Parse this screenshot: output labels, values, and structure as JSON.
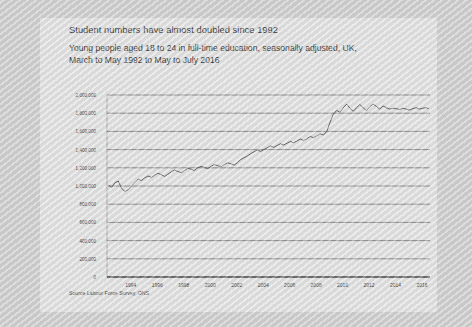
{
  "title": "Student numbers have almost doubled since 1992",
  "subtitle": "Young people aged 18 to 24 in full-time education, seasonally adjusted, UK, March to May 1992 to May to July 2016",
  "source": "Source Labour Force Survey, ONS",
  "colors": {
    "page_background": "#cfcfcf",
    "card_background": "#e3e3e3",
    "line": "#4a4a4a",
    "gridline": "#6f6f6f",
    "axis": "#3a3a3a",
    "text": "#2b2b2b"
  },
  "chart_data": {
    "type": "line",
    "title": "Student numbers have almost doubled since 1992",
    "subtitle": "Young people aged 18 to 24 in full-time education, seasonally adjusted, UK, March to May 1992 to May to July 2016",
    "xlabel": "",
    "ylabel": "",
    "grid": true,
    "legend": false,
    "xlim": [
      1992.2,
      2016.6
    ],
    "ylim": [
      0,
      2000000
    ],
    "ytick_labels": [
      "2,000,000",
      "1,800,000",
      "1,600,000",
      "1,400,000",
      "1,200,000",
      "1,000,000",
      "800,000",
      "600,000",
      "400,000",
      "200,000",
      "0"
    ],
    "ytick_values": [
      2000000,
      1800000,
      1600000,
      1400000,
      1200000,
      1000000,
      800000,
      600000,
      400000,
      200000,
      0
    ],
    "xtick_labels": [
      "1994",
      "1996",
      "1998",
      "2000",
      "2002",
      "2004",
      "2006",
      "2008",
      "2010",
      "2012",
      "2014",
      "2016"
    ],
    "xtick_values": [
      1994,
      1996,
      1998,
      2000,
      2002,
      2004,
      2006,
      2008,
      2010,
      2012,
      2014,
      2016
    ],
    "series": [
      {
        "name": "Young people aged 18 to 24 in full-time education",
        "x": [
          1992.3,
          1992.55,
          1992.8,
          1993.05,
          1993.3,
          1993.55,
          1993.8,
          1994.05,
          1994.3,
          1994.55,
          1994.8,
          1995.05,
          1995.3,
          1995.55,
          1995.8,
          1996.05,
          1996.3,
          1996.55,
          1996.8,
          1997.05,
          1997.3,
          1997.55,
          1997.8,
          1998.05,
          1998.3,
          1998.55,
          1998.8,
          1999.05,
          1999.3,
          1999.55,
          1999.8,
          2000.05,
          2000.3,
          2000.55,
          2000.8,
          2001.05,
          2001.3,
          2001.55,
          2001.8,
          2002.05,
          2002.3,
          2002.55,
          2002.8,
          2003.05,
          2003.3,
          2003.55,
          2003.8,
          2004.05,
          2004.3,
          2004.55,
          2004.8,
          2005.05,
          2005.3,
          2005.55,
          2005.8,
          2006.05,
          2006.3,
          2006.55,
          2006.8,
          2007.05,
          2007.3,
          2007.55,
          2007.8,
          2008.05,
          2008.3,
          2008.55,
          2008.8,
          2009.05,
          2009.3,
          2009.55,
          2009.8,
          2010.05,
          2010.3,
          2010.55,
          2010.8,
          2011.05,
          2011.3,
          2011.55,
          2011.8,
          2012.05,
          2012.3,
          2012.55,
          2012.8,
          2013.05,
          2013.3,
          2013.55,
          2013.8,
          2014.05,
          2014.3,
          2014.55,
          2014.8,
          2015.05,
          2015.3,
          2015.55,
          2015.8,
          2016.05,
          2016.3,
          2016.5
        ],
        "values": [
          1010000,
          985000,
          1035000,
          1055000,
          975000,
          940000,
          960000,
          1000000,
          1035000,
          1075000,
          1060000,
          1090000,
          1110000,
          1095000,
          1120000,
          1140000,
          1125000,
          1105000,
          1130000,
          1155000,
          1175000,
          1160000,
          1145000,
          1170000,
          1195000,
          1185000,
          1170000,
          1200000,
          1215000,
          1205000,
          1190000,
          1215000,
          1235000,
          1225000,
          1210000,
          1235000,
          1255000,
          1245000,
          1230000,
          1255000,
          1290000,
          1310000,
          1330000,
          1355000,
          1375000,
          1395000,
          1380000,
          1400000,
          1420000,
          1440000,
          1425000,
          1445000,
          1465000,
          1450000,
          1470000,
          1490000,
          1475000,
          1495000,
          1515000,
          1500000,
          1520000,
          1545000,
          1530000,
          1550000,
          1575000,
          1560000,
          1600000,
          1700000,
          1790000,
          1830000,
          1810000,
          1860000,
          1900000,
          1855000,
          1820000,
          1860000,
          1895000,
          1860000,
          1830000,
          1870000,
          1900000,
          1875000,
          1845000,
          1880000,
          1860000,
          1845000,
          1855000,
          1850000,
          1840000,
          1855000,
          1845000,
          1835000,
          1850000,
          1860000,
          1845000,
          1855000,
          1860000,
          1850000
        ]
      }
    ]
  }
}
